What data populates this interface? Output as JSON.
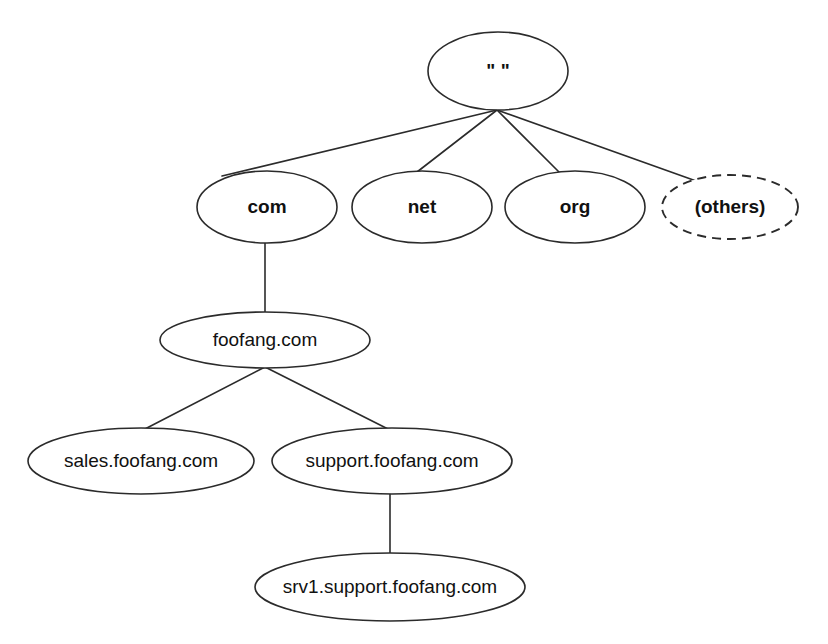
{
  "diagram": {
    "type": "tree",
    "background_color": "#ffffff",
    "stroke_color": "#2b2b2b",
    "text_color": "#111111",
    "nodes": [
      {
        "id": "root",
        "label": "\" \"",
        "level": 0,
        "cx": 498,
        "cy": 71,
        "rx": 70,
        "ry": 39,
        "font_size": 19,
        "weight": "bold",
        "border": "solid"
      },
      {
        "id": "com",
        "label": "com",
        "level": 1,
        "cx": 267,
        "cy": 207,
        "rx": 70,
        "ry": 36,
        "font_size": 19,
        "weight": "bold",
        "border": "solid"
      },
      {
        "id": "net",
        "label": "net",
        "level": 1,
        "cx": 422,
        "cy": 207,
        "rx": 70,
        "ry": 36,
        "font_size": 19,
        "weight": "bold",
        "border": "solid"
      },
      {
        "id": "org",
        "label": "org",
        "level": 1,
        "cx": 575,
        "cy": 207,
        "rx": 70,
        "ry": 36,
        "font_size": 19,
        "weight": "bold",
        "border": "solid"
      },
      {
        "id": "others",
        "label": "(others)",
        "level": 1,
        "cx": 730,
        "cy": 207,
        "rx": 68,
        "ry": 32,
        "font_size": 19,
        "weight": "bold",
        "border": "dashed"
      },
      {
        "id": "foofang",
        "label": "foofang.com",
        "level": 2,
        "cx": 265,
        "cy": 340,
        "rx": 105,
        "ry": 28,
        "font_size": 19,
        "weight": "normal",
        "border": "solid"
      },
      {
        "id": "sales",
        "label": "sales.foofang.com",
        "level": 3,
        "cx": 141,
        "cy": 461,
        "rx": 113,
        "ry": 33,
        "font_size": 19,
        "weight": "normal",
        "border": "solid"
      },
      {
        "id": "support",
        "label": "support.foofang.com",
        "level": 3,
        "cx": 392,
        "cy": 461,
        "rx": 120,
        "ry": 33,
        "font_size": 19,
        "weight": "normal",
        "border": "solid"
      },
      {
        "id": "srv1",
        "label": "srv1.support.foofang.com",
        "level": 4,
        "cx": 390,
        "cy": 587,
        "rx": 135,
        "ry": 34,
        "font_size": 19,
        "weight": "normal",
        "border": "solid"
      }
    ],
    "edges": [
      {
        "id": "root-com",
        "from": "root",
        "to": "com",
        "x1": 497,
        "y1": 110,
        "x2": 222,
        "y2": 176
      },
      {
        "id": "root-net",
        "from": "root",
        "to": "net",
        "x1": 497,
        "y1": 110,
        "x2": 417,
        "y2": 172
      },
      {
        "id": "root-org",
        "from": "root",
        "to": "org",
        "x1": 497,
        "y1": 110,
        "x2": 561,
        "y2": 174
      },
      {
        "id": "root-others",
        "from": "root",
        "to": "others",
        "x1": 497,
        "y1": 110,
        "x2": 699,
        "y2": 182
      },
      {
        "id": "com-foofang",
        "from": "com",
        "to": "foofang",
        "x1": 265,
        "y1": 243,
        "x2": 265,
        "y2": 313
      },
      {
        "id": "foofang-sales",
        "from": "foofang",
        "to": "sales",
        "x1": 265,
        "y1": 367,
        "x2": 143,
        "y2": 430
      },
      {
        "id": "foofang-support",
        "from": "foofang",
        "to": "support",
        "x1": 265,
        "y1": 367,
        "x2": 390,
        "y2": 430
      },
      {
        "id": "support-srv1",
        "from": "support",
        "to": "srv1",
        "x1": 390,
        "y1": 493,
        "x2": 390,
        "y2": 554
      }
    ]
  }
}
